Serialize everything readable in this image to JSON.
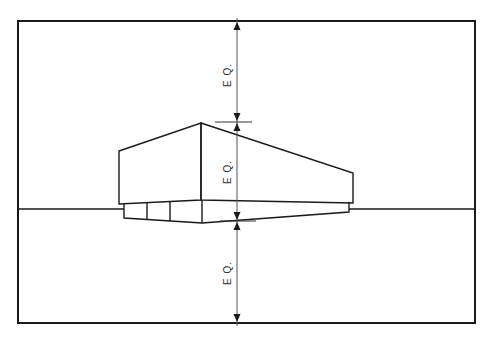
{
  "diagram": {
    "type": "perspective-drawing",
    "frame": {
      "x": 18,
      "y": 21,
      "width": 457,
      "height": 302
    },
    "horizon_y": 209,
    "dimension_labels": [
      {
        "id": "upper",
        "text": "E Q.",
        "meaning": "equal spacing: frame top to building top"
      },
      {
        "id": "middle",
        "text": "E Q.",
        "meaning": "equal spacing: building top to building base"
      },
      {
        "id": "lower",
        "text": "E Q.",
        "meaning": "equal spacing: building base to frame bottom"
      }
    ],
    "colors": {
      "line": "#1a1a1a",
      "dimension_line": "#555555",
      "background": "#ffffff"
    }
  }
}
